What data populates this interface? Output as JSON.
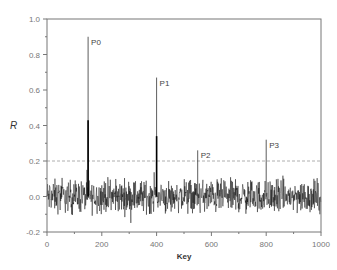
{
  "chart_data": {
    "type": "line",
    "title": "",
    "xlabel": "Key",
    "ylabel": "R",
    "xlim": [
      0,
      1000
    ],
    "ylim": [
      -0.2,
      1.0
    ],
    "x_ticks": [
      0,
      200,
      400,
      600,
      800,
      1000
    ],
    "x_tick_labels": [
      "0",
      "200",
      "400",
      "600",
      "800",
      "1000"
    ],
    "x_minor_ticks": [
      100,
      300,
      500,
      700,
      900
    ],
    "y_ticks": [
      -0.2,
      0.0,
      0.2,
      0.4,
      0.6,
      0.8,
      1.0
    ],
    "y_tick_labels": [
      "-0.2",
      "0.0",
      "0.2",
      "0.4",
      "0.6",
      "0.8",
      "1.0"
    ],
    "grid": false,
    "threshold": {
      "value": 0.2,
      "style": "dashed"
    },
    "noise": {
      "x_range": [
        0,
        1000
      ],
      "mean": 0.0,
      "amplitude_range": [
        -0.17,
        0.15
      ],
      "description": "random fluctuation around 0"
    },
    "peaks": [
      {
        "label": "P0",
        "key": 150,
        "value": 0.9,
        "inner_value": 0.43
      },
      {
        "label": "P1",
        "key": 400,
        "value": 0.67,
        "inner_value": 0.34
      },
      {
        "label": "P2",
        "key": 550,
        "value": 0.26
      },
      {
        "label": "P3",
        "key": 800,
        "value": 0.32
      }
    ],
    "colors": {
      "line": "#000000",
      "axis": "#777777",
      "threshold": "#999999"
    }
  },
  "axis": {
    "x_title": "Key",
    "y_title": "R"
  }
}
